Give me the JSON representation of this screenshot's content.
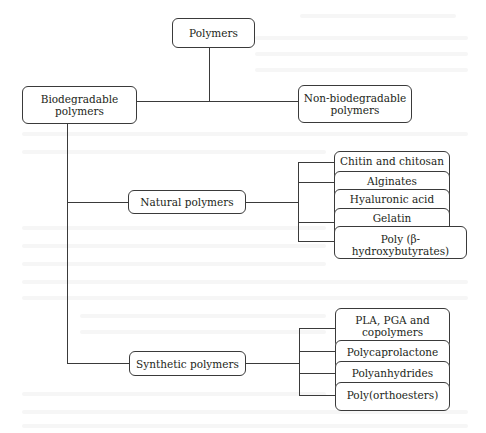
{
  "diagram": {
    "type": "tree",
    "root": {
      "label": "Polymers",
      "children": [
        {
          "label": "Biodegradable polymers",
          "children": [
            {
              "label": "Natural polymers",
              "children": [
                {
                  "label": "Chitin and chitosan"
                },
                {
                  "label": "Alginates"
                },
                {
                  "label": "Hyaluronic acid"
                },
                {
                  "label": "Gelatin"
                },
                {
                  "label": "Poly (β-hydroxybutyrates)"
                }
              ]
            },
            {
              "label": "Synthetic polymers",
              "children": [
                {
                  "label": "PLA, PGA and copolymers"
                },
                {
                  "label": "Polycaprolactone"
                },
                {
                  "label": "Polyanhydrides"
                },
                {
                  "label": "Poly(orthoesters)"
                }
              ]
            }
          ]
        },
        {
          "label": "Non-biodegradable polymers"
        }
      ]
    }
  },
  "nodes": {
    "root": "Polymers",
    "biodegradable": [
      "Biodegradable",
      "polymers"
    ],
    "non_biodegradable": [
      "Non-biodegradable",
      "polymers"
    ],
    "natural": "Natural polymers",
    "synthetic": "Synthetic polymers",
    "natural_leaves": [
      "Chitin and chitosan",
      "Alginates",
      "Hyaluronic acid",
      "Gelatin",
      "Poly (β-hydroxybutyrates)"
    ],
    "synthetic_leaves": [
      [
        "PLA, PGA and",
        "copolymers"
      ],
      "Polycaprolactone",
      "Polyanhydrides",
      "Poly(orthoesters)"
    ]
  },
  "colors": {
    "line": "#3a3a3a",
    "text": "#231f20",
    "background": "#ffffff"
  }
}
